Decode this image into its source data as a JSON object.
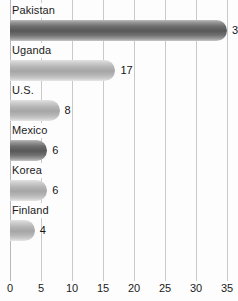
{
  "chart_data": {
    "type": "bar",
    "orientation": "horizontal",
    "title": "",
    "xlabel": "",
    "ylabel": "",
    "categories": [
      "Pakistan",
      "Uganda",
      "U.S.",
      "Mexico",
      "Korea",
      "Finland"
    ],
    "values": [
      35,
      17,
      8,
      6,
      6,
      4
    ],
    "value_labels": [
      "3",
      "17",
      "8",
      "6",
      "6",
      "4"
    ],
    "series": [
      {
        "name": "Percentage",
        "values": [
          35,
          17,
          8,
          6,
          6,
          4
        ]
      }
    ],
    "bars": [
      {
        "category": "Pakistan",
        "value": 35,
        "label": "3",
        "shade": "dark"
      },
      {
        "category": "Uganda",
        "value": 17,
        "label": "17",
        "shade": "light"
      },
      {
        "category": "U.S.",
        "value": 8,
        "label": "8",
        "shade": "light"
      },
      {
        "category": "Mexico",
        "value": 6,
        "label": "6",
        "shade": "dark"
      },
      {
        "category": "Korea",
        "value": 6,
        "label": "6",
        "shade": "light"
      },
      {
        "category": "Finland",
        "value": 4,
        "label": "4",
        "shade": "light"
      }
    ],
    "xticks": [
      0,
      5,
      10,
      15,
      20,
      25,
      30,
      35
    ],
    "xtick_labels": [
      "0",
      "5",
      "10",
      "15",
      "20",
      "25",
      "30",
      "35"
    ],
    "xlim": [
      0,
      36.7
    ],
    "grid": true,
    "grid_axis": "x",
    "legend": false,
    "caption": "",
    "colors": {
      "bar_dark": "#585858",
      "bar_light": "#a6a6a6",
      "gridline": "#c9c9c9",
      "text": "#1b1b1b",
      "background": "#fdfdfd"
    }
  }
}
